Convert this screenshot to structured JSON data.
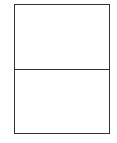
{
  "diagram": {
    "type": "rectangle-split-horizontal",
    "panels": [
      {
        "id": "top",
        "label": ""
      },
      {
        "id": "bottom",
        "label": ""
      }
    ],
    "colors": {
      "background": "#ffffff",
      "stroke": "#333333"
    }
  }
}
